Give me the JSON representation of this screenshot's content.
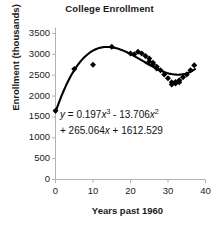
{
  "chart_data": {
    "type": "scatter",
    "title": "College Enrollment",
    "xlabel": "Years past 1960",
    "ylabel": "Enrollment (thousands)",
    "xlim": [
      0,
      40
    ],
    "ylim": [
      0,
      3500
    ],
    "xticks": [
      0,
      10,
      20,
      30,
      40
    ],
    "yticks": [
      0,
      500,
      1000,
      1500,
      2000,
      2500,
      3000,
      3500
    ],
    "grid": false,
    "legend": null,
    "series": [
      {
        "name": "Enrollment data",
        "marker": "diamond",
        "color": "#000000",
        "x": [
          0,
          5,
          10,
          15,
          20,
          21,
          22,
          23,
          24,
          25,
          25,
          26,
          26,
          27,
          27,
          28,
          29,
          30,
          31,
          31,
          32,
          32,
          33,
          33,
          34,
          35,
          36,
          37
        ],
        "y": [
          1650,
          2650,
          2750,
          3180,
          3020,
          3000,
          3060,
          3020,
          2960,
          2900,
          2830,
          2800,
          2760,
          2700,
          2660,
          2620,
          2520,
          2430,
          2330,
          2280,
          2340,
          2300,
          2380,
          2330,
          2450,
          2520,
          2620,
          2740
        ]
      }
    ],
    "fit": {
      "name": "cubic regression curve",
      "coefficients": [
        0.197,
        -13.706,
        265.064,
        1612.529
      ],
      "equation_lines": [
        {
          "lhs": "y",
          "rest": " = 0.197",
          "var1": "x",
          "sup1": "3",
          "tail": " - 13.706",
          "var2": "x",
          "sup2": "2"
        },
        {
          "text_a": "+ 265.064",
          "var": "x",
          "text_b": " + 1612.529"
        }
      ],
      "equation_plain": "y = 0.197x^3 - 13.706x^2 + 265.064x + 1612.529"
    },
    "tick_label_strings": {
      "y": [
        "3500",
        "3000",
        "2500",
        "2000",
        "1500",
        "1000",
        "500",
        "0"
      ],
      "x": [
        "0",
        "10",
        "20",
        "30",
        "40"
      ]
    }
  },
  "colors": {
    "marker": "#000000",
    "curve": "#000000",
    "axis": "#b3b3b3",
    "text": "#1a1a1a",
    "background": "#ffffff"
  }
}
